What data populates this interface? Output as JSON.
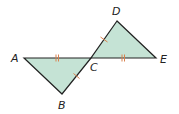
{
  "diagram": {
    "colors": {
      "fill": "#c5e3d5",
      "stroke": "#222222",
      "tick": "#d9824f",
      "background": "#ffffff"
    },
    "points": {
      "A": {
        "x": 24,
        "y": 58
      },
      "B": {
        "x": 62,
        "y": 94
      },
      "C": {
        "x": 91,
        "y": 58
      },
      "D": {
        "x": 117,
        "y": 21
      },
      "E": {
        "x": 156,
        "y": 58
      }
    },
    "labels": [
      {
        "id": "A",
        "text": "A",
        "x": 11,
        "y": 62
      },
      {
        "id": "B",
        "text": "B",
        "x": 58,
        "y": 109
      },
      {
        "id": "C",
        "text": "C",
        "x": 90,
        "y": 71
      },
      {
        "id": "D",
        "text": "D",
        "x": 112,
        "y": 15
      },
      {
        "id": "E",
        "text": "E",
        "x": 160,
        "y": 63
      }
    ],
    "triangles": [
      {
        "name": "triangle-ABC",
        "vertices": [
          "A",
          "B",
          "C"
        ]
      },
      {
        "name": "triangle-DCE",
        "vertices": [
          "D",
          "C",
          "E"
        ]
      }
    ],
    "congruence_marks": [
      {
        "segment": "AC",
        "ticks": 2
      },
      {
        "segment": "CE",
        "ticks": 2
      },
      {
        "segment": "BC",
        "ticks": 1
      },
      {
        "segment": "CD",
        "ticks": 1
      }
    ]
  }
}
